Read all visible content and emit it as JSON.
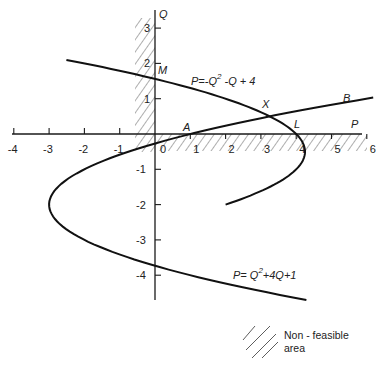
{
  "diagram": {
    "axes": {
      "x_label": "P",
      "y_label": "Q",
      "origin_label": "0",
      "x_ticks": [
        "-4",
        "-3",
        "-2",
        "-1",
        "1",
        "2",
        "3",
        "4",
        "5",
        "6"
      ],
      "x_tick_values": [
        -4,
        -3,
        -2,
        -1,
        1,
        2,
        3,
        4,
        5,
        6
      ],
      "y_ticks": [
        "3",
        "2",
        "1",
        "-1",
        "-2",
        "-3",
        "-4"
      ],
      "y_tick_values": [
        3,
        2,
        1,
        -1,
        -2,
        -3,
        -4
      ]
    },
    "curves": [
      {
        "name": "curve-1",
        "equation_prefix": "P=-Q",
        "equation_exp": "2",
        "equation_suffix": " -Q + 4",
        "formula": "P = -Q^2 - Q + 4",
        "q_range": [
          -2,
          2.1
        ]
      },
      {
        "name": "curve-2",
        "equation_prefix": "P= Q",
        "equation_exp": "2",
        "equation_suffix": "+4Q+1",
        "formula": "P = Q^2 + 4Q + 1",
        "q_range": [
          -4.7,
          1.03
        ]
      }
    ],
    "points": {
      "M": "M",
      "A": "A",
      "X": "X",
      "L": "L",
      "B": "B"
    },
    "legend": {
      "line1": "Non - feasible",
      "line2": "area"
    }
  }
}
